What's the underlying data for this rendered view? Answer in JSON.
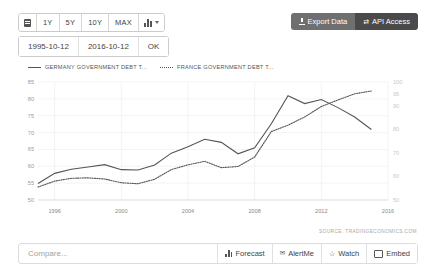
{
  "toolbar": {
    "calendar_icon": "calendar-icon",
    "ranges": [
      "1Y",
      "5Y",
      "10Y",
      "MAX"
    ],
    "charttype_icon": "bar-chart-icon",
    "export_label": "Export Data",
    "export_icon": "download-icon",
    "api_label": "API Access",
    "api_icon": "exchange-icon"
  },
  "daterange": {
    "from": "1995-10-12",
    "to": "2016-10-12",
    "ok_label": "OK"
  },
  "legend": [
    {
      "label": "GERMANY GOVERNMENT DEBT T...",
      "style": "solid"
    },
    {
      "label": "FRANCE GOVERNMENT DEBT T...",
      "style": "dotted"
    }
  ],
  "source": "SOURCE: TRADINGECONOMICS.COM",
  "bottom": {
    "compare_placeholder": "Compare...",
    "compare_value": "",
    "buttons": [
      {
        "label": "Forecast",
        "icon": "forecast-icon"
      },
      {
        "label": "AlertMe",
        "icon": "envelope-icon"
      },
      {
        "label": "Watch",
        "icon": "star-icon"
      },
      {
        "label": "Embed",
        "icon": "embed-icon"
      }
    ]
  },
  "chart_data": {
    "type": "line",
    "title": "",
    "xlabel": "",
    "ylabel": "",
    "grid": true,
    "legend_position": "top-left",
    "x": [
      1995,
      1996,
      1997,
      1998,
      1999,
      2000,
      2001,
      2002,
      2003,
      2004,
      2005,
      2006,
      2007,
      2008,
      2009,
      2010,
      2011,
      2012,
      2013,
      2014,
      2015
    ],
    "xticks": [
      "1996",
      "2000",
      "2004",
      "2008",
      "2012",
      "2016"
    ],
    "xtick_values": [
      1996,
      2000,
      2004,
      2008,
      2012,
      2016
    ],
    "xlim": [
      1995,
      2016
    ],
    "yleft_ticks": [
      85,
      80,
      75,
      70,
      65,
      60,
      55,
      50
    ],
    "ylim_left": [
      50,
      85
    ],
    "yright_ticks": [
      100,
      95,
      90,
      80,
      70,
      60,
      50
    ],
    "ylim_right": [
      50,
      100
    ],
    "series": [
      {
        "name": "GERMANY GOVERNMENT DEBT T...",
        "style": "solid",
        "axis": "left",
        "color": "#555555",
        "values": [
          54.9,
          57.9,
          59.1,
          59.8,
          60.5,
          59.0,
          58.9,
          60.4,
          63.9,
          65.8,
          68.0,
          67.1,
          63.7,
          65.5,
          72.6,
          80.9,
          78.6,
          79.8,
          77.4,
          74.6,
          70.9
        ]
      },
      {
        "name": "FRANCE GOVERNMENT DEBT T...",
        "style": "dotted",
        "axis": "right",
        "color": "#555555",
        "values": [
          55.5,
          58.0,
          59.2,
          59.4,
          58.9,
          57.3,
          56.9,
          58.8,
          62.9,
          64.9,
          66.4,
          63.7,
          64.2,
          68.2,
          79.0,
          81.7,
          85.2,
          89.6,
          92.4,
          95.0,
          96.2
        ]
      }
    ]
  }
}
